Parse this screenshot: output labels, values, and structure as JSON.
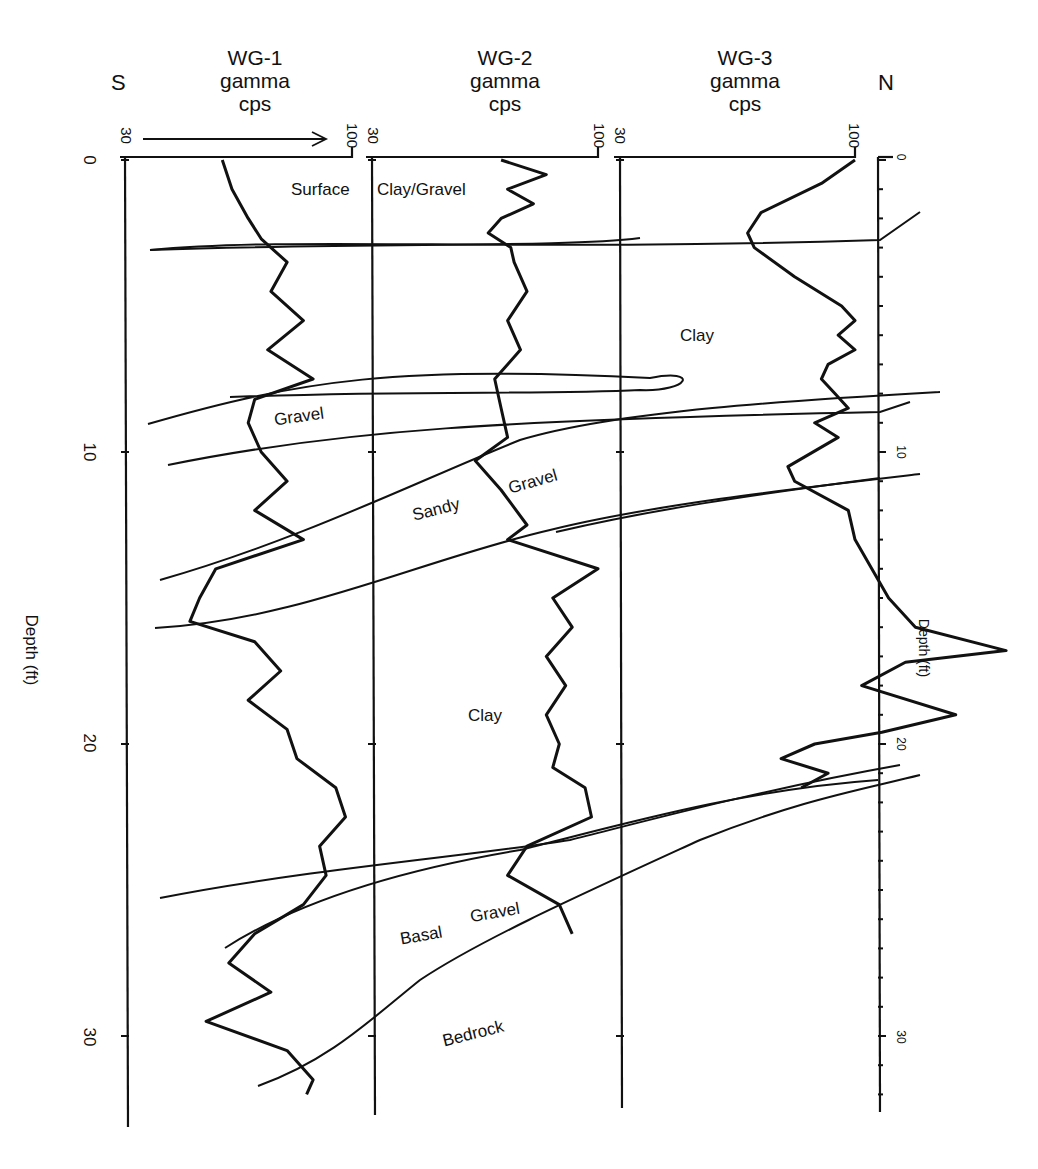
{
  "figure": {
    "left_direction": "S",
    "right_direction": "N",
    "depth_axis_label": "Depth (ft)",
    "right_depth_axis_label": "Depth (ft)",
    "scale_min_label": "30",
    "scale_max_label": "100"
  },
  "wells": [
    {
      "name": "WG-1",
      "line2": "gamma",
      "line3": "cps"
    },
    {
      "name": "WG-2",
      "line2": "gamma",
      "line3": "cps"
    },
    {
      "name": "WG-3",
      "line2": "gamma",
      "line3": "cps"
    }
  ],
  "depth_ticks": {
    "left": [
      "0",
      "10",
      "20",
      "30"
    ],
    "right": [
      "0",
      "10",
      "20",
      "30"
    ]
  },
  "units": [
    {
      "label": "Surface"
    },
    {
      "label": "Clay/Gravel"
    },
    {
      "label": "Clay"
    },
    {
      "label": "Gravel"
    },
    {
      "label": "Sandy"
    },
    {
      "label": "Gravel"
    },
    {
      "label": "Clay"
    },
    {
      "label": "Basal"
    },
    {
      "label": "Gravel"
    },
    {
      "label": "Bedrock"
    }
  ],
  "chart_data": {
    "type": "line",
    "xlabel": "gamma cps (30–100 per track)",
    "ylabel": "Depth (ft)",
    "ylim": [
      0,
      32
    ],
    "xlim_per_track": [
      30,
      100
    ],
    "depth_ticks": [
      0,
      10,
      20,
      30
    ],
    "series": [
      {
        "name": "WG-1 gamma cps",
        "depth": [
          0,
          1,
          2,
          2.7,
          3.5,
          4.5,
          5.5,
          6.5,
          7.5,
          8.2,
          9,
          10,
          11,
          12,
          13,
          14,
          15,
          15.8,
          16.5,
          17.5,
          18.5,
          19.5,
          20.5,
          21.5,
          22.5,
          23.5,
          24.5,
          25.5,
          26.5,
          27.5,
          28.5,
          29.5,
          30.5,
          31.5,
          32
        ],
        "values": [
          60,
          63,
          68,
          72,
          80,
          75,
          85,
          74,
          88,
          70,
          68,
          72,
          80,
          70,
          85,
          58,
          53,
          50,
          70,
          78,
          68,
          80,
          83,
          95,
          98,
          90,
          92,
          85,
          70,
          62,
          75,
          55,
          80,
          88,
          86
        ]
      },
      {
        "name": "WG-2 gamma cps",
        "depth": [
          0,
          0.5,
          1,
          1.5,
          2,
          2.5,
          3,
          3.5,
          4.5,
          5.5,
          6.5,
          7.5,
          8.5,
          9.5,
          10.3,
          11.3,
          12.5,
          13,
          14,
          15,
          16,
          17,
          18,
          19,
          20,
          20.8,
          21.5,
          22.5,
          23.5,
          24.5,
          25.5,
          26.5
        ],
        "values": [
          70,
          84,
          72,
          80,
          70,
          66,
          73,
          74,
          78,
          72,
          76,
          68,
          70,
          72,
          62,
          70,
          78,
          72,
          100,
          86,
          92,
          84,
          90,
          84,
          88,
          86,
          96,
          98,
          78,
          72,
          88,
          92
        ]
      },
      {
        "name": "WG-3 gamma cps",
        "depth": [
          0,
          0.8,
          1.8,
          2.5,
          3,
          4,
          5,
          5.5,
          6,
          6.5,
          7,
          7.5,
          8,
          8.5,
          9,
          9.5,
          10.5,
          11,
          12,
          13,
          14,
          15,
          16,
          16.8,
          17.2,
          18,
          19,
          19.6,
          20,
          20.5,
          21,
          21.5
        ],
        "values": [
          100,
          90,
          72,
          68,
          70,
          82,
          96,
          100,
          95,
          100,
          92,
          90,
          94,
          98,
          88,
          95,
          80,
          82,
          98,
          100,
          105,
          110,
          118,
          145,
          115,
          102,
          130,
          108,
          88,
          78,
          92,
          84
        ]
      }
    ],
    "annotations": [
      "Surface Clay/Gravel",
      "Clay",
      "Gravel",
      "Sandy Gravel",
      "Clay",
      "Basal Gravel",
      "Bedrock",
      "S",
      "N"
    ],
    "grid": false,
    "legend": "none"
  }
}
